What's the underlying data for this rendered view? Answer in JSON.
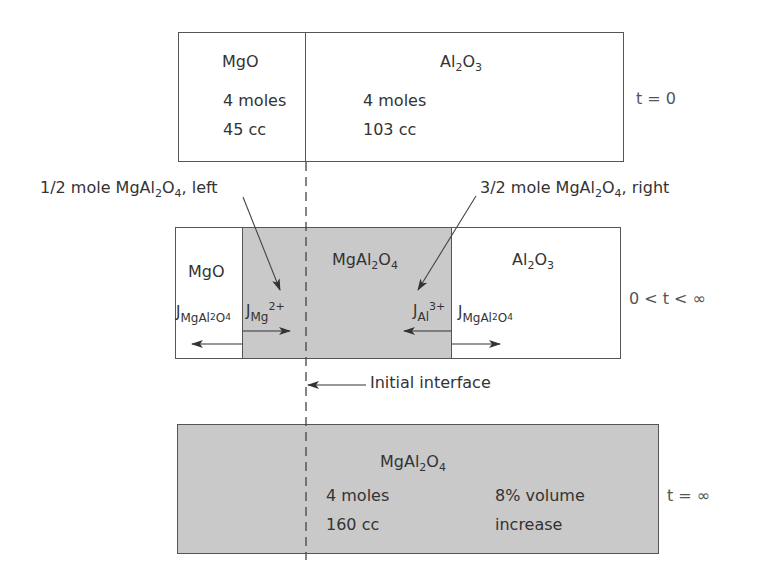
{
  "top": {
    "mgo": {
      "label": "MgO",
      "moles": "4 moles",
      "volume": "45 cc"
    },
    "al2o3": {
      "label_base": "Al",
      "label_sub1": "2",
      "label_mid": "O",
      "label_sub2": "3",
      "moles": "4 moles",
      "volume": "103 cc"
    },
    "time_label": "t = 0"
  },
  "annotations": {
    "left": {
      "prefix": "1/2 mole MgAl",
      "sub1": "2",
      "mid": "O",
      "sub2": "4",
      "suffix": ", left"
    },
    "right": {
      "prefix": "3/2 mole MgAl",
      "sub1": "2",
      "mid": "O",
      "sub2": "4",
      "suffix": ", right"
    },
    "initial_interface": "Initial interface"
  },
  "middle": {
    "mgo": "MgO",
    "spinel": {
      "base": "MgAl",
      "sub1": "2",
      "mid": "O",
      "sub2": "4"
    },
    "al2o3": {
      "base": "Al",
      "sub1": "2",
      "mid": "O",
      "sub2": "3"
    },
    "flux_left": {
      "J": "J",
      "sub": "MgAl",
      "sub_sub": "2",
      "sub_mid": "O",
      "sub_sub2": "4"
    },
    "flux_mg": {
      "J": "J",
      "sub": "Mg",
      "sup": "2+"
    },
    "flux_al": {
      "J": "J",
      "sub": "Al",
      "sup": "3+"
    },
    "flux_right": {
      "J": "J",
      "sub": "MgAl",
      "sub_sub": "2",
      "sub_mid": "O",
      "sub_sub2": "4"
    },
    "time_label": "0 < t < ∞"
  },
  "bottom": {
    "spinel": {
      "base": "MgAl",
      "sub1": "2",
      "mid": "O",
      "sub2": "4"
    },
    "moles": "4 moles",
    "volume": "160 cc",
    "note_line1": "8% volume",
    "note_line2": "increase",
    "time_label": "t = ∞"
  },
  "colors": {
    "fill_gray": "#c9c9c9",
    "line": "#555555",
    "text": "#333333"
  }
}
